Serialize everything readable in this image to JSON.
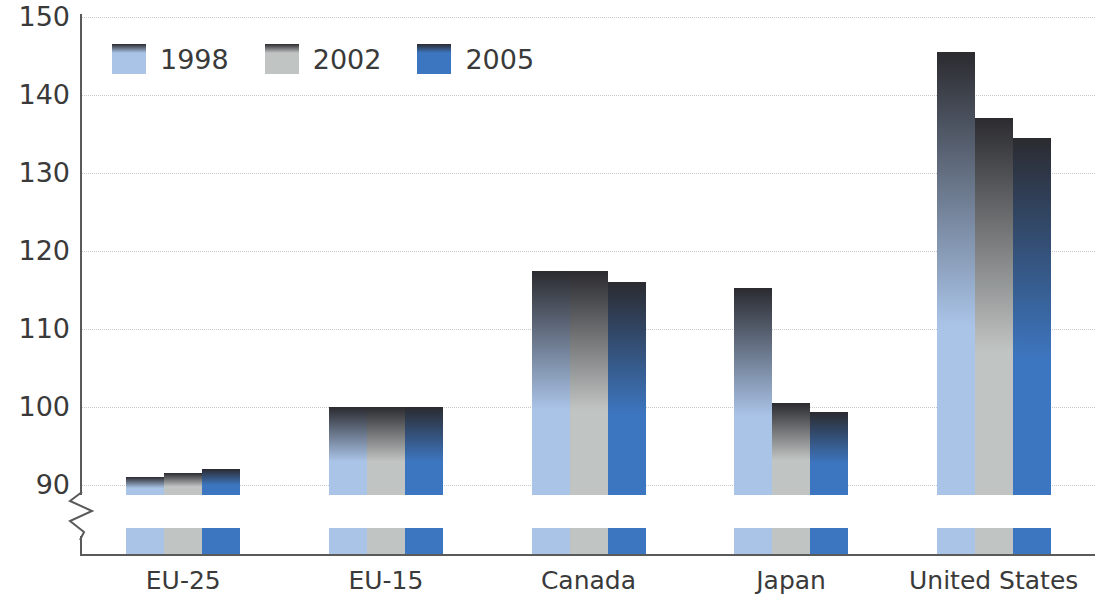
{
  "chart_data": {
    "type": "bar",
    "title": "",
    "subtitle": "",
    "xlabel": "",
    "ylabel": "",
    "categories": [
      "EU-25",
      "EU-15",
      "Canada",
      "Japan",
      "United States"
    ],
    "series": [
      {
        "name": "1998",
        "color": "#aac4e8",
        "values": [
          91.0,
          100.0,
          117.5,
          115.3,
          145.5
        ]
      },
      {
        "name": "2002",
        "color": "#c0c4c2",
        "values": [
          91.5,
          100.0,
          117.5,
          100.5,
          137.0
        ]
      },
      {
        "name": "2005",
        "color": "#3d76c0",
        "values": [
          92.0,
          100.0,
          116.0,
          99.4,
          134.5
        ]
      }
    ],
    "ylim": [
      90,
      150
    ],
    "ytick_labels": [
      "150",
      "140",
      "130",
      "120",
      "110",
      "100",
      "90"
    ],
    "ytick_values": [
      150,
      140,
      130,
      120,
      110,
      100,
      90
    ],
    "ytick_step": 10,
    "axis_break": true,
    "axis_break_below": 90,
    "grid": true,
    "grid_style": "dotted",
    "grid_color": "#c9c9c9",
    "legend_position": "top-left",
    "bar_gradient_top_color": "#2b2b30",
    "axis_color": "#5a5a5a",
    "text_color": "#3a3a3a"
  },
  "legend": {
    "items": [
      {
        "label": "1998"
      },
      {
        "label": "2002"
      },
      {
        "label": "2005"
      }
    ]
  }
}
